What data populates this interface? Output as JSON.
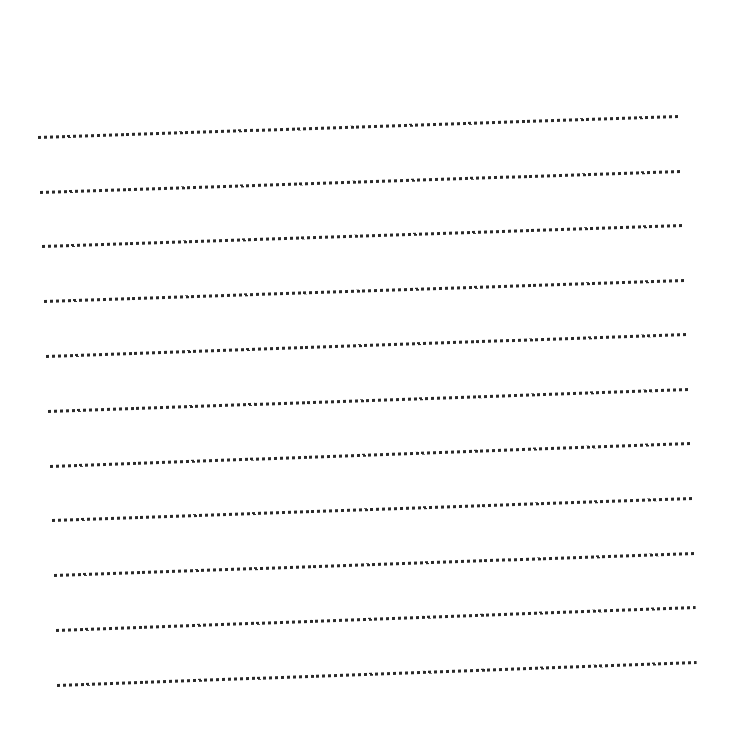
{
  "page": {
    "type": "ruled-sheet",
    "background_color": "#ffffff",
    "rule_color": "#2a2a2a",
    "rule_style": "dotted",
    "rule_count": 11
  },
  "rules": [
    {
      "index": 1,
      "x1": 38,
      "y1": 137,
      "x2": 679,
      "y2": 116
    },
    {
      "index": 2,
      "x1": 40,
      "y1": 192,
      "x2": 681,
      "y2": 171
    },
    {
      "index": 3,
      "x1": 42,
      "y1": 246,
      "x2": 683,
      "y2": 225
    },
    {
      "index": 4,
      "x1": 44,
      "y1": 301,
      "x2": 685,
      "y2": 280
    },
    {
      "index": 5,
      "x1": 46,
      "y1": 356,
      "x2": 687,
      "y2": 334
    },
    {
      "index": 6,
      "x1": 48,
      "y1": 411,
      "x2": 689,
      "y2": 389
    },
    {
      "index": 7,
      "x1": 50,
      "y1": 466,
      "x2": 691,
      "y2": 443
    },
    {
      "index": 8,
      "x1": 52,
      "y1": 520,
      "x2": 693,
      "y2": 498
    },
    {
      "index": 9,
      "x1": 54,
      "y1": 575,
      "x2": 695,
      "y2": 553
    },
    {
      "index": 10,
      "x1": 56,
      "y1": 630,
      "x2": 696,
      "y2": 607
    },
    {
      "index": 11,
      "x1": 57,
      "y1": 685,
      "x2": 697,
      "y2": 662
    }
  ]
}
